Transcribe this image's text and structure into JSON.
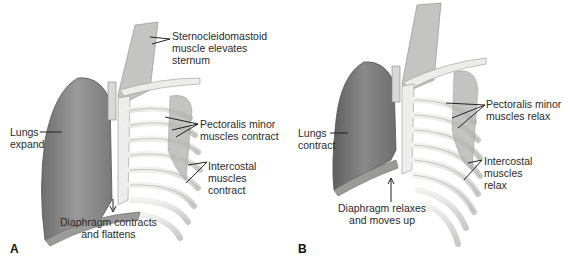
{
  "figure": {
    "panels": [
      {
        "letter": "A",
        "state": "inhalation",
        "labels": {
          "scm": "Sternocleidomastoid\nmuscle elevates\nsternum",
          "pectoralis": "Pectoralis minor\nmuscles contract",
          "lungs": "Lungs\nexpand",
          "intercostal": "Intercostal\nmuscles\ncontract",
          "diaphragm": "Diaphragm contracts\nand flattens"
        }
      },
      {
        "letter": "B",
        "state": "exhalation",
        "labels": {
          "pectoralis": "Pectoralis minor\nmuscles relax",
          "lungs": "Lungs\ncontract",
          "intercostal": "Intercostal\nmuscles\nrelax",
          "diaphragm": "Diaphragm relaxes\nand moves up"
        }
      }
    ],
    "colors": {
      "lung": "#8a8a8a",
      "lung_dark": "#5e5e5e",
      "bone": "#e6e6e4",
      "muscle": "#b9b9b7",
      "line": "#333333"
    }
  }
}
